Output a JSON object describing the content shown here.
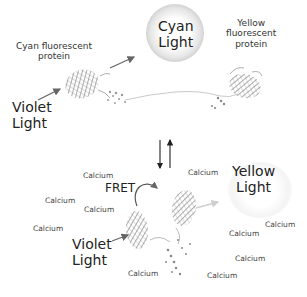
{
  "diagram": {
    "top_state": {
      "cfp_label": "Cyan fluorescent\nprotein",
      "cfp_label_line1": "Cyan fluorescent",
      "cfp_label_line2": "protein",
      "excitation_label_line1": "Violet",
      "excitation_label_line2": "Light",
      "emission_label_line1": "Cyan",
      "emission_label_line2": "Light",
      "yfp_label_line1": "Yellow",
      "yfp_label_line2": "fluorescent",
      "yfp_label_line3": "protein"
    },
    "transition": {
      "arrows": [
        "down",
        "up"
      ]
    },
    "bottom_state": {
      "fret_label": "FRET",
      "excitation_label_line1": "Violet",
      "excitation_label_line2": "Light",
      "emission_label_line1": "Yellow",
      "emission_label_line2": "Light",
      "calcium_labels": [
        "Calcium",
        "Calcium",
        "Calcium",
        "Calcium",
        "Calcium",
        "Calcium",
        "Calcium",
        "Calcium",
        "Calcium",
        "Calcium"
      ]
    },
    "colors": {
      "cyan_glow": "#d9d9d9",
      "yellow_glow": "#f2f2f2",
      "arrow": "#666666",
      "protein": "#8a8a8a"
    }
  }
}
